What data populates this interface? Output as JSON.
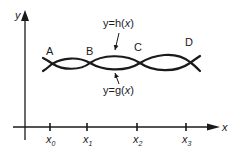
{
  "diagram": {
    "axes": {
      "x_label": "x",
      "y_label": "y"
    },
    "ticks": [
      {
        "base": "x",
        "sub": "0"
      },
      {
        "base": "x",
        "sub": "1"
      },
      {
        "base": "x",
        "sub": "2"
      },
      {
        "base": "x",
        "sub": "3"
      }
    ],
    "curves": {
      "h": {
        "label_prefix": "y=h(",
        "label_var": "x",
        "label_suffix": ")"
      },
      "g": {
        "label_prefix": "y=g(",
        "label_var": "x",
        "label_suffix": ")"
      }
    },
    "points": [
      {
        "label": "A"
      },
      {
        "label": "B"
      },
      {
        "label": "C"
      },
      {
        "label": "D"
      }
    ],
    "colors": {
      "ink": "#1a1a1a",
      "background": "#ffffff"
    }
  }
}
